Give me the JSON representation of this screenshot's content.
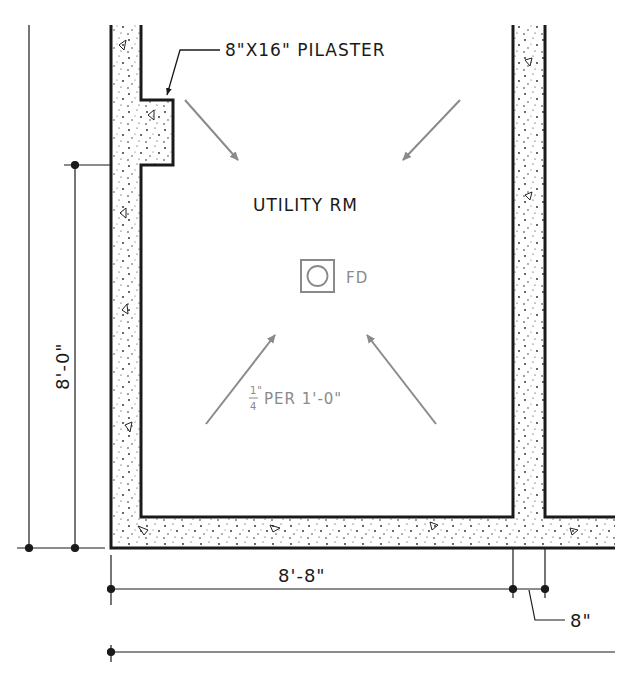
{
  "drawing": {
    "room_label": "UTILITY RM",
    "pilaster_label": "8\"X16\" PILASTER",
    "floor_drain_label": "FD",
    "slope_fraction_num": "1\"",
    "slope_fraction_den": "4",
    "slope_text": "PER 1'-0\"",
    "dim_vertical": "8'-0\"",
    "dim_horizontal": "8'-8\"",
    "dim_wall_thickness": "8\""
  },
  "colors": {
    "ink": "#1a1a1a",
    "arrow_gray": "#8a8a8a",
    "background": "#ffffff"
  }
}
